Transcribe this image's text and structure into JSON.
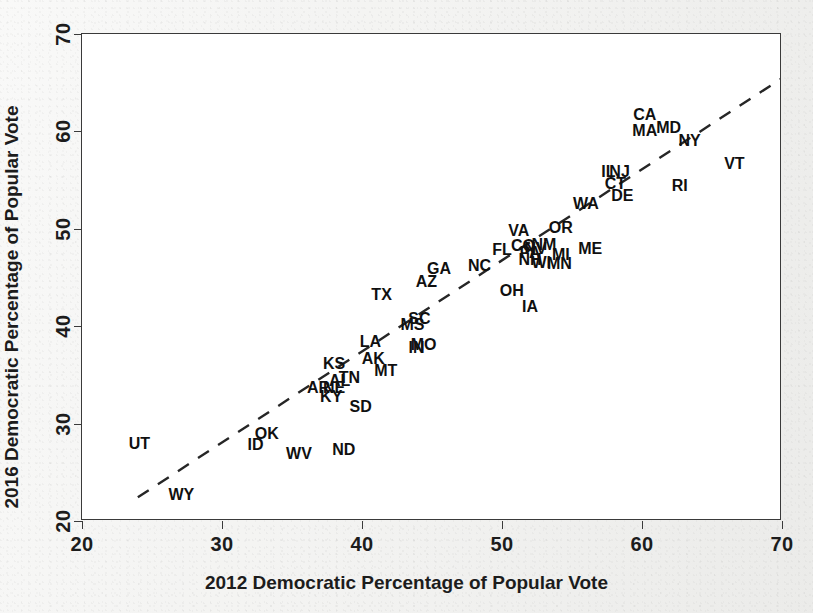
{
  "chart_data": {
    "type": "scatter",
    "title": "",
    "xlabel": "2012 Democratic Percentage of Popular Vote",
    "ylabel": "2016 Democratic Percentage of Popular Vote",
    "xlim": [
      20,
      70
    ],
    "ylim": [
      20,
      70
    ],
    "xticks": [
      "20",
      "30",
      "40",
      "50",
      "60",
      "70"
    ],
    "yticks": [
      "20",
      "30",
      "40",
      "50",
      "60",
      "70"
    ],
    "xtick_values": [
      20,
      30,
      40,
      50,
      60,
      70
    ],
    "ytick_values": [
      20,
      30,
      40,
      50,
      60,
      70
    ],
    "grid": false,
    "legend": "none",
    "marker_style": "text-labels",
    "trendline": {
      "style": "dashed",
      "x_start": 24.0,
      "y_start": 22.3,
      "x_end": 71.7,
      "y_end": 66.9
    },
    "points": [
      {
        "label": "UT",
        "x": 24.1,
        "y": 27.9
      },
      {
        "label": "WY",
        "x": 27.1,
        "y": 22.7
      },
      {
        "label": "ID",
        "x": 32.4,
        "y": 27.8
      },
      {
        "label": "OK",
        "x": 33.2,
        "y": 28.9
      },
      {
        "label": "WV",
        "x": 35.5,
        "y": 26.9
      },
      {
        "label": "ND",
        "x": 38.7,
        "y": 27.3
      },
      {
        "label": "AR",
        "x": 36.9,
        "y": 33.7
      },
      {
        "label": "NE",
        "x": 38.0,
        "y": 33.7
      },
      {
        "label": "KY",
        "x": 37.8,
        "y": 32.7
      },
      {
        "label": "SD",
        "x": 39.9,
        "y": 31.7
      },
      {
        "label": "KS",
        "x": 38.0,
        "y": 36.1
      },
      {
        "label": "AL",
        "x": 38.4,
        "y": 34.4
      },
      {
        "label": "TN",
        "x": 39.1,
        "y": 34.7
      },
      {
        "label": "MT",
        "x": 41.7,
        "y": 35.4
      },
      {
        "label": "AK",
        "x": 40.8,
        "y": 36.6
      },
      {
        "label": "LA",
        "x": 40.6,
        "y": 38.4
      },
      {
        "label": "MO",
        "x": 44.4,
        "y": 38.1
      },
      {
        "label": "IN",
        "x": 43.9,
        "y": 37.8
      },
      {
        "label": "MS",
        "x": 43.6,
        "y": 40.1
      },
      {
        "label": "SC",
        "x": 44.1,
        "y": 40.7
      },
      {
        "label": "TX",
        "x": 41.4,
        "y": 43.2
      },
      {
        "label": "AZ",
        "x": 44.6,
        "y": 44.5
      },
      {
        "label": "GA",
        "x": 45.5,
        "y": 45.9
      },
      {
        "label": "NC",
        "x": 48.4,
        "y": 46.2
      },
      {
        "label": "FL",
        "x": 50.0,
        "y": 47.8
      },
      {
        "label": "NH",
        "x": 52.0,
        "y": 46.8
      },
      {
        "label": "OH",
        "x": 50.7,
        "y": 43.6
      },
      {
        "label": "IA",
        "x": 52.0,
        "y": 42.0
      },
      {
        "label": "WI",
        "x": 52.8,
        "y": 46.5
      },
      {
        "label": "MN",
        "x": 54.1,
        "y": 46.4
      },
      {
        "label": "PA",
        "x": 52.0,
        "y": 47.5
      },
      {
        "label": "MI",
        "x": 54.2,
        "y": 47.3
      },
      {
        "label": "VA",
        "x": 51.2,
        "y": 49.8
      },
      {
        "label": "CO",
        "x": 51.5,
        "y": 48.2
      },
      {
        "label": "NV",
        "x": 52.4,
        "y": 47.9
      },
      {
        "label": "NM",
        "x": 53.0,
        "y": 48.3
      },
      {
        "label": "ME",
        "x": 56.3,
        "y": 47.9
      },
      {
        "label": "OR",
        "x": 54.2,
        "y": 50.1
      },
      {
        "label": "WA",
        "x": 56.0,
        "y": 52.5
      },
      {
        "label": "DE",
        "x": 58.6,
        "y": 53.4
      },
      {
        "label": "CT",
        "x": 58.1,
        "y": 54.6
      },
      {
        "label": "IL",
        "x": 57.6,
        "y": 55.8
      },
      {
        "label": "NJ",
        "x": 58.4,
        "y": 55.8
      },
      {
        "label": "RI",
        "x": 62.7,
        "y": 54.4
      },
      {
        "label": "VT",
        "x": 66.6,
        "y": 56.7
      },
      {
        "label": "NY",
        "x": 63.4,
        "y": 59.0
      },
      {
        "label": "MD",
        "x": 61.9,
        "y": 60.3
      },
      {
        "label": "MA",
        "x": 60.2,
        "y": 60.0
      },
      {
        "label": "CA",
        "x": 60.2,
        "y": 61.7
      },
      {
        "label": "HI",
        "x": 70.6,
        "y": 62.3
      },
      {
        "label": "DC",
        "x": 0,
        "y": 0,
        "hidden": true
      }
    ]
  },
  "axes": {
    "x_title": "2012 Democratic Percentage of Popular Vote",
    "y_title": "2016 Democratic Percentage of Popular Vote"
  }
}
